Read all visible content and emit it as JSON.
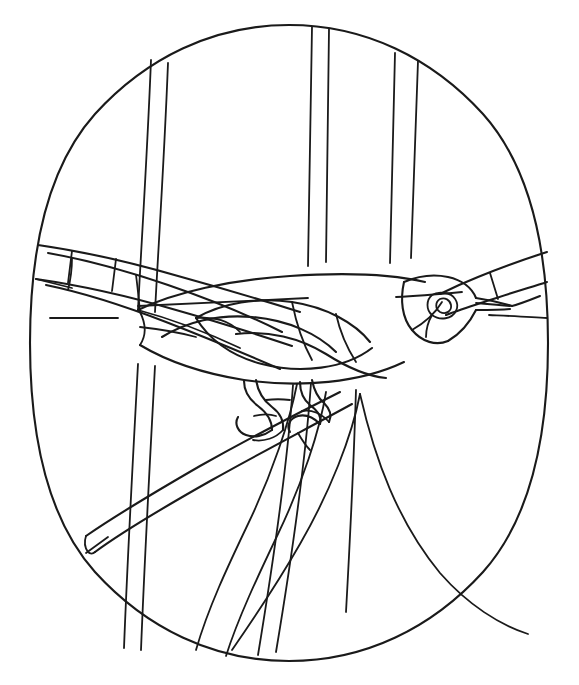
{
  "artwork": {
    "title": "Bird on Branch",
    "subject": "songbird perched on a diagonal branch among vertical reeds",
    "style": "stained glass pattern / line art coloring page",
    "medium": "black outline on white",
    "canvas": {
      "width": 579,
      "height": 685
    },
    "colors": {
      "line": "#1a1a1a",
      "background": "#ffffff",
      "glass_fill": "#ffffff"
    },
    "border": {
      "shape": "oval",
      "center_x": 289,
      "center_y": 343,
      "radius_x": 259,
      "radius_y": 318
    }
  },
  "elements": {
    "oval_border": "oval-border",
    "bird": {
      "head": "bird-head",
      "eye": "bird-eye",
      "beak": "bird-beak",
      "body": "bird-body",
      "wing": "bird-wing",
      "tail": "bird-tail",
      "feet": "bird-feet"
    },
    "background": {
      "reeds": "vertical-reed-stems",
      "branch_main": "diagonal-branch",
      "branch_upper_right": "upper-right-twig",
      "branch_upper_left": "upper-left-twig"
    }
  },
  "counts": {
    "reed_stems": 7,
    "branches": 3,
    "glass_segments": 34
  }
}
